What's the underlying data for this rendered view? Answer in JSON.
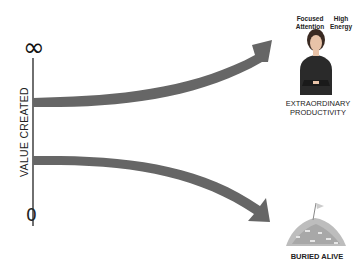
{
  "axis": {
    "top_label": "∞",
    "bottom_label": "0",
    "y_label": "VALUE CREATED"
  },
  "top_outcome": {
    "left_note": "Focused Attention",
    "right_note": "High Energy",
    "image": "businesswoman-arms-crossed",
    "caption_line1": "EXTRAORDINARY",
    "caption_line2": "PRODUCTIVITY"
  },
  "bottom_outcome": {
    "image": "pile-of-papers-with-flag",
    "caption": "BURIED ALIVE"
  },
  "colors": {
    "arrow": "#666666",
    "axis": "#222222",
    "text": "#222222"
  }
}
